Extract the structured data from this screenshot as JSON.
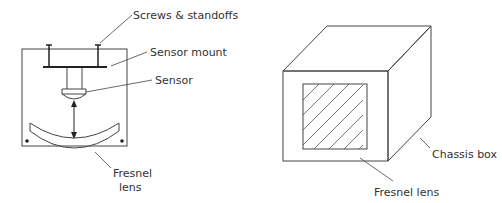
{
  "left_diagram": {
    "labels": {
      "screws": "Screws & standoffs",
      "mount": "Sensor mount",
      "sensor": "Sensor",
      "lens_line1": "Fresnel",
      "lens_line2": "lens"
    }
  },
  "right_diagram": {
    "labels": {
      "chassis": "Chassis box",
      "lens": "Fresnel lens"
    }
  },
  "colors": {
    "line": "#444444",
    "text": "#333333",
    "background": "#ffffff"
  }
}
